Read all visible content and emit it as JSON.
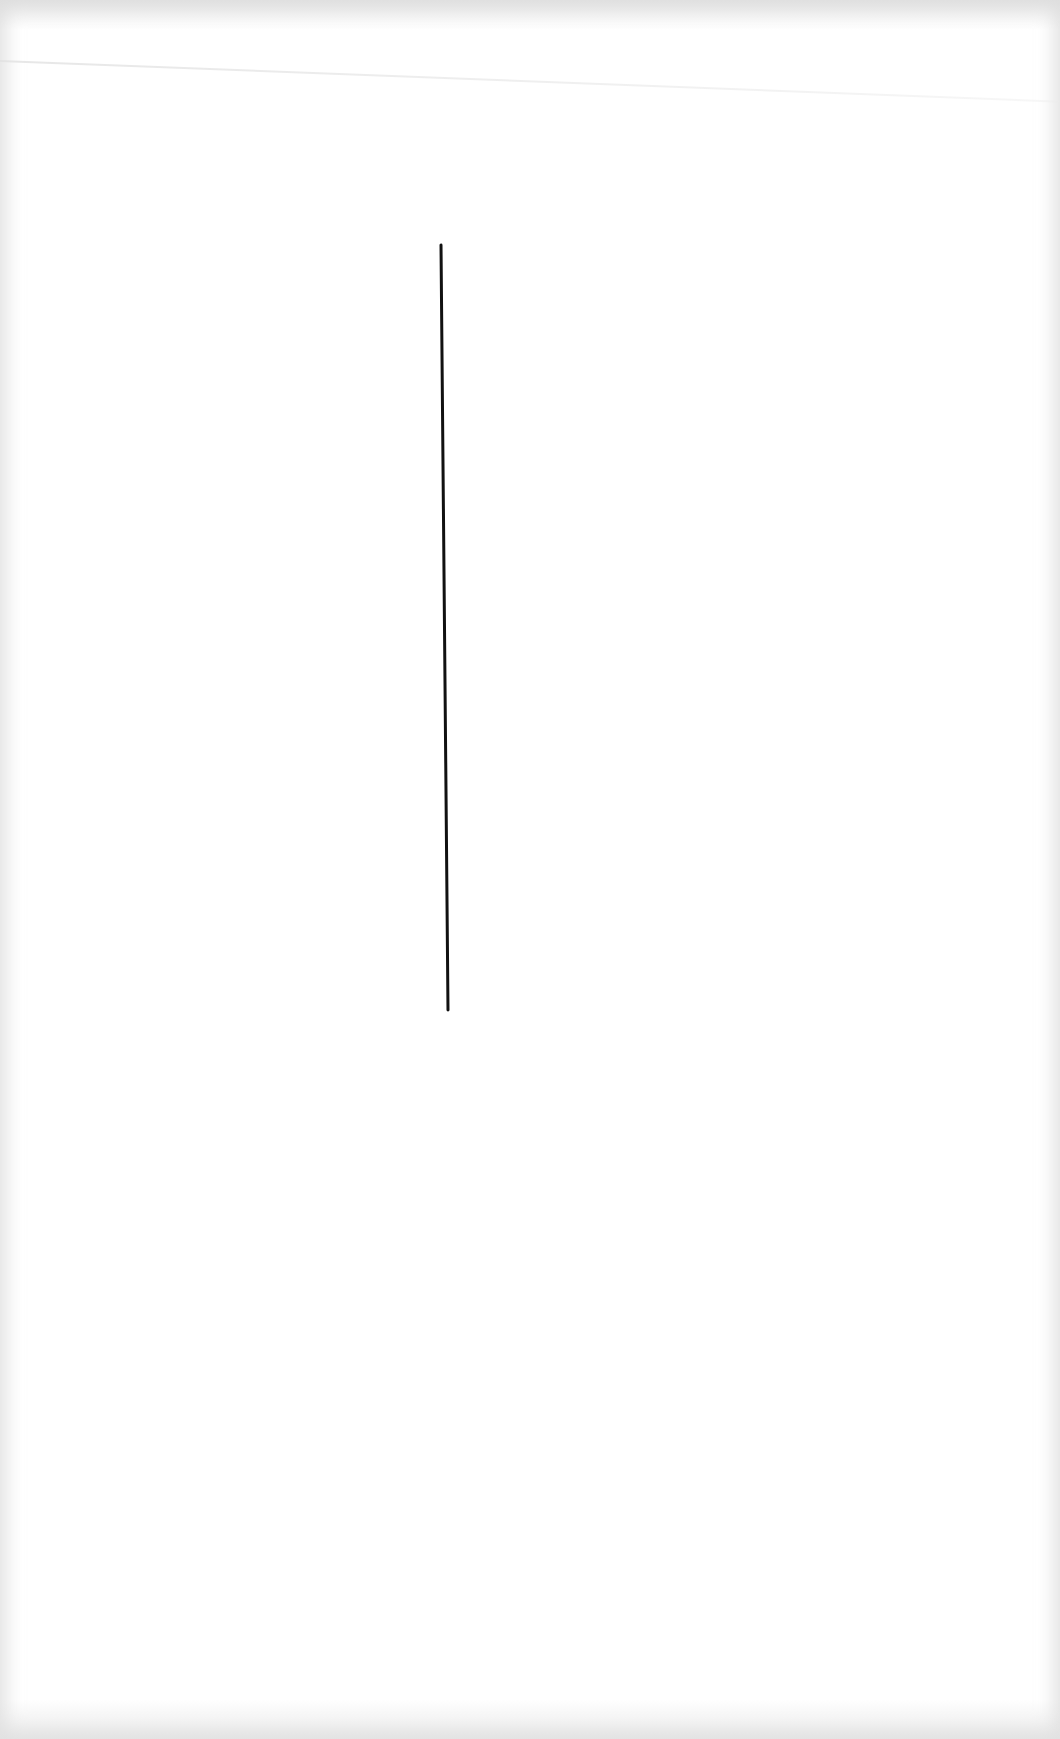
{
  "page": {
    "background_color": "#ffffff",
    "border_tint": "#e0e0e0"
  },
  "drawing": {
    "stroke_color": "#111111",
    "line": {
      "x1": 441,
      "y1": 245,
      "x2": 448,
      "y2": 1010,
      "stroke_width": 3
    }
  }
}
